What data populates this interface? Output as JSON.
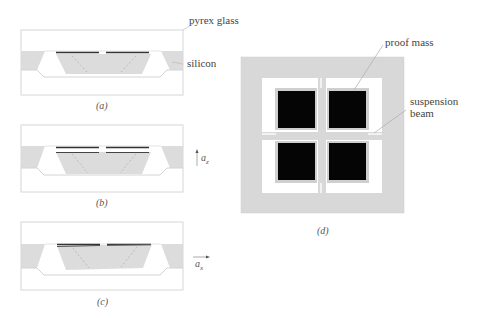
{
  "labels": {
    "pyrex_glass": "pyrex glass",
    "silicon": "silicon",
    "proof_mass": "proof mass",
    "suspension_beam_line1": "suspension",
    "suspension_beam_line2": "beam"
  },
  "captions": {
    "a": "(a)",
    "b": "(b)",
    "c": "(c)",
    "d": "(d)"
  },
  "axes": {
    "az_base": "a",
    "az_sub": "z",
    "ax_base": "a",
    "ax_sub": "x"
  },
  "colors": {
    "silicon": "#dcdcdc",
    "glass_outline": "#d0d0d0",
    "electrode": "#333333",
    "proof_mass_top_view": "#050505",
    "frame": "#d8d8d8"
  }
}
